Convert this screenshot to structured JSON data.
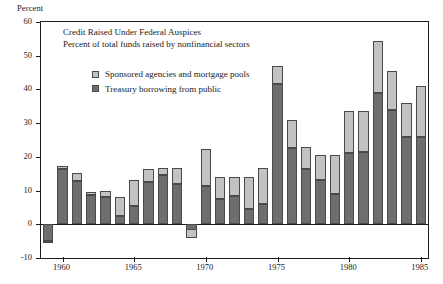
{
  "axis": {
    "unit_label": "Percent",
    "y_ticks": [
      60,
      50,
      40,
      30,
      20,
      10,
      0,
      -10
    ],
    "x_ticks": [
      1960,
      1965,
      1970,
      1975,
      1980,
      1985
    ]
  },
  "titles": {
    "line1": "Credit Raised Under Federal Auspices",
    "line2": "Percent of total funds raised by nonfinancial sectors"
  },
  "legend": {
    "items": [
      {
        "label": "Sponsored agencies and mortgage pools",
        "color": "#c2c2c2",
        "swatch": "light"
      },
      {
        "label": "Treasury borrowing from public",
        "color": "#6e6e6e",
        "swatch": "dark"
      }
    ]
  },
  "chart_data": {
    "type": "bar",
    "stacked": true,
    "title": "Credit Raised Under Federal Auspices",
    "subtitle": "Percent of total funds raised by nonfinancial sectors",
    "xlabel": "",
    "ylabel": "Percent",
    "ylim": [
      -10,
      60
    ],
    "xlim": [
      1958.5,
      1985.5
    ],
    "grid": false,
    "legend_position": "inside-top-left",
    "categories": [
      1959,
      1960,
      1961,
      1962,
      1963,
      1964,
      1965,
      1966,
      1967,
      1968,
      1969,
      1970,
      1971,
      1972,
      1973,
      1974,
      1975,
      1976,
      1977,
      1978,
      1979,
      1980,
      1981,
      1982,
      1983,
      1984,
      1985
    ],
    "series": [
      {
        "name": "Treasury borrowing from public",
        "color": "#6e6e6e",
        "values": [
          -5.0,
          16.5,
          12.7,
          8.8,
          8.0,
          2.5,
          5.5,
          12.5,
          14.5,
          12.0,
          -4.0,
          11.5,
          7.5,
          8.5,
          4.5,
          6.0,
          41.5,
          22.5,
          16.5,
          13.0,
          9.0,
          21.0,
          21.5,
          39.0,
          34.0,
          26.0,
          26.0
        ]
      },
      {
        "name": "Sponsored agencies and mortgage pools",
        "color": "#c2c2c2",
        "values": [
          -0.5,
          0.7,
          2.5,
          0.8,
          1.9,
          5.5,
          7.5,
          4.0,
          2.2,
          4.8,
          2.5,
          10.8,
          6.5,
          5.5,
          9.5,
          10.8,
          5.5,
          8.5,
          6.5,
          7.5,
          11.5,
          12.5,
          12.0,
          15.5,
          11.5,
          10.0,
          15.0
        ]
      }
    ],
    "totals": [
      -5.5,
      17.2,
      15.2,
      9.6,
      9.9,
      8.0,
      13.0,
      16.5,
      16.7,
      16.8,
      -1.5,
      22.3,
      14.0,
      14.0,
      14.0,
      16.8,
      47.0,
      31.0,
      23.0,
      20.5,
      20.5,
      33.5,
      33.5,
      54.5,
      45.5,
      36.0,
      41.0
    ]
  }
}
